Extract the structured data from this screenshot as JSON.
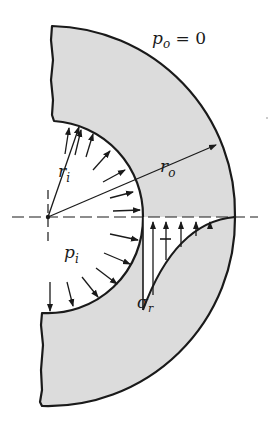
{
  "figure": {
    "type": "thick-walled cylinder cross-section with radial stress distribution",
    "colors": {
      "material_fill": "#dcdcdc",
      "stroke": "#1a1a1a",
      "background": "#ffffff"
    },
    "labels": {
      "outer_pressure_symbol": "p",
      "outer_pressure_sub": "o",
      "outer_pressure_eq": " = 0",
      "inner_radius_symbol": "r",
      "inner_radius_sub": "i",
      "outer_radius_symbol": "r",
      "outer_radius_sub": "o",
      "inner_pressure_symbol": "p",
      "inner_pressure_sub": "i",
      "radial_stress_symbol": "σ",
      "radial_stress_sub": "r",
      "sign_label": "–"
    }
  }
}
